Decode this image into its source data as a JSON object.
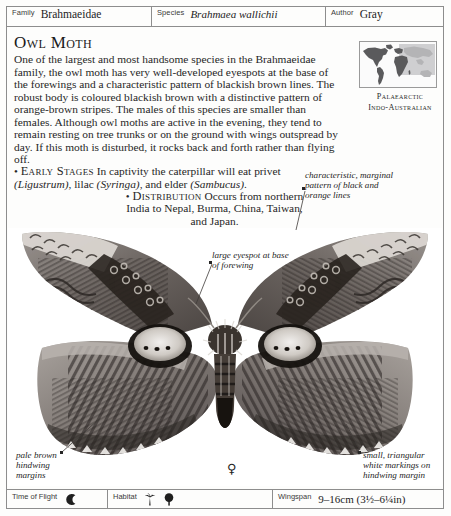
{
  "header": {
    "fields": [
      {
        "label": "Family",
        "value": "Brahmaeidae",
        "italic": false
      },
      {
        "label": "Species",
        "value": "Brahmaea wallichii",
        "italic": true
      },
      {
        "label": "Author",
        "value": "Gray",
        "italic": false
      }
    ]
  },
  "title": "Owl Moth",
  "description": {
    "paragraph_1": "One of the largest and most handsome species in the Brahmaeidae family, the owl moth has very well-developed eyespots at the base of the forewings and a characteristic pattern of blackish brown lines. The robust body is coloured blackish brown with a distinctive pattern of orange-brown stripes. The males of this species are smaller than females. Although owl moths are active in the evening, they tend to remain resting on tree trunks or on the ground with wings outspread by day. If this moth is disturbed, it rocks back and forth rather than flying off.",
    "early_stages_label": "Early Stages",
    "early_stages_text_1": "In captivity the caterpillar will eat privet",
    "early_stages_genus_1": "(Ligustrum)",
    "early_stages_text_2": ", lilac ",
    "early_stages_genus_2": "(Syringa)",
    "early_stages_text_3": ", and elder ",
    "early_stages_genus_3": "(Sambucus)",
    "early_stages_text_4": ".",
    "distribution_label": "Distribution",
    "distribution_text": "Occurs from northern India to Nepal, Burma, China, Taiwan, and Japan.",
    "bullet": "•"
  },
  "map": {
    "caption_line_1": "Palaearctic",
    "caption_line_2": "Indo-Australian",
    "land_color": "#58585a",
    "highlight_color": "#c9c9cb",
    "background_color": "#fbfbfb"
  },
  "annotations": {
    "top_right": "characteristic, marginal\npattern of black and\norange lines",
    "middle": "large eyespot at base\nof forewing",
    "bottom_left": "pale brown\nhindwing\nmargins",
    "bottom_right": "small, triangular\nwhite markings on\nhindwing margin"
  },
  "specimen": {
    "sex_symbol": "♀",
    "alt": "owl-moth-specimen-photograph"
  },
  "footer": {
    "time_of_flight_label": "Time of Flight",
    "time_of_flight_icon": "crescent-moon-icon",
    "habitat_label": "Habitat",
    "habitat_icons": [
      "palm-tree-icon",
      "broadleaf-tree-icon"
    ],
    "wingspan_label": "Wingspan",
    "wingspan_value": "9–16cm (3½–6¼in)"
  }
}
